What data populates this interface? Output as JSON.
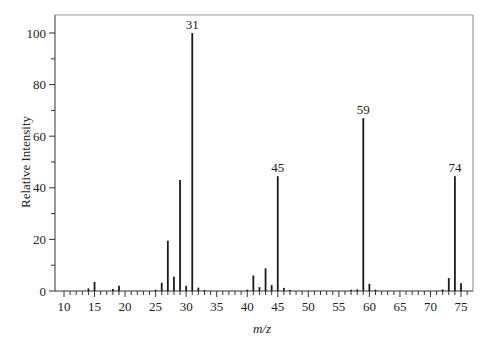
{
  "chart_data": {
    "type": "bar",
    "subtype": "mass-spectrum-stick",
    "title": "",
    "xlabel": "m/z",
    "ylabel": "Relative Intensity",
    "xlim": [
      10,
      77
    ],
    "ylim": [
      0,
      105
    ],
    "grid": false,
    "legend": null,
    "x_ticks_major": [
      10,
      15,
      20,
      25,
      30,
      35,
      40,
      45,
      50,
      55,
      60,
      65,
      70,
      75
    ],
    "x_tick_labels": [
      "10",
      "15",
      "20",
      "25",
      "30",
      "35",
      "40",
      "45",
      "50",
      "55",
      "60",
      "65",
      "70",
      "75"
    ],
    "y_ticks_major": [
      0,
      20,
      40,
      60,
      80,
      100
    ],
    "y_tick_labels": [
      "0",
      "20",
      "40",
      "60",
      "80",
      "100"
    ],
    "y_ticks_minor": [
      10,
      30,
      50,
      70,
      90
    ],
    "peaks": [
      {
        "mz": 14,
        "intensity": 1.0
      },
      {
        "mz": 15,
        "intensity": 3.5
      },
      {
        "mz": 18,
        "intensity": 0.8
      },
      {
        "mz": 19,
        "intensity": 2.0
      },
      {
        "mz": 25,
        "intensity": 0.5
      },
      {
        "mz": 26,
        "intensity": 3.2
      },
      {
        "mz": 27,
        "intensity": 19.5
      },
      {
        "mz": 28,
        "intensity": 5.5
      },
      {
        "mz": 29,
        "intensity": 43.0
      },
      {
        "mz": 30,
        "intensity": 2.0
      },
      {
        "mz": 31,
        "intensity": 100.0
      },
      {
        "mz": 32,
        "intensity": 1.3
      },
      {
        "mz": 33,
        "intensity": 0.4
      },
      {
        "mz": 40,
        "intensity": 0.5
      },
      {
        "mz": 41,
        "intensity": 6.0
      },
      {
        "mz": 42,
        "intensity": 1.5
      },
      {
        "mz": 43,
        "intensity": 8.8
      },
      {
        "mz": 44,
        "intensity": 2.3
      },
      {
        "mz": 45,
        "intensity": 44.5
      },
      {
        "mz": 46,
        "intensity": 1.2
      },
      {
        "mz": 47,
        "intensity": 0.4
      },
      {
        "mz": 57,
        "intensity": 0.5
      },
      {
        "mz": 58,
        "intensity": 0.6
      },
      {
        "mz": 59,
        "intensity": 67.0
      },
      {
        "mz": 60,
        "intensity": 2.8
      },
      {
        "mz": 61,
        "intensity": 0.5
      },
      {
        "mz": 72,
        "intensity": 0.6
      },
      {
        "mz": 73,
        "intensity": 5.0
      },
      {
        "mz": 74,
        "intensity": 44.5
      },
      {
        "mz": 75,
        "intensity": 3.0
      }
    ],
    "annotations": [
      {
        "mz": 31,
        "label": "31"
      },
      {
        "mz": 45,
        "label": "45"
      },
      {
        "mz": 59,
        "label": "59"
      },
      {
        "mz": 74,
        "label": "74"
      }
    ]
  },
  "colors": {
    "bar": "#1a1a1a",
    "axis": "#333333",
    "frame": "#999999",
    "text": "#222222"
  }
}
